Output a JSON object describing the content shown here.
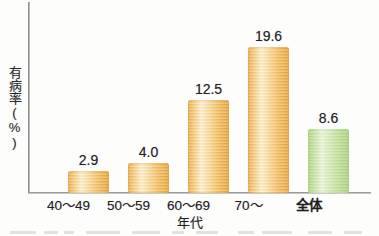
{
  "chart_data": {
    "type": "bar",
    "title": "",
    "xlabel": "年代",
    "ylabel": "有病率(%)",
    "categories": [
      "40～49",
      "50～59",
      "60～69",
      "70～",
      "全体"
    ],
    "values": [
      2.9,
      4.0,
      12.5,
      19.6,
      8.6
    ],
    "value_labels": [
      "2.9",
      "4.0",
      "12.5",
      "19.6",
      "8.6"
    ],
    "series": [
      {
        "name": "有病率",
        "values": [
          2.9,
          4.0,
          12.5,
          19.6,
          8.6
        ]
      }
    ],
    "bar_colors": [
      "#f0b44a",
      "#f0b44a",
      "#f0b44a",
      "#f0b44a",
      "#b5d98c"
    ],
    "highlight_category": "全体",
    "highlight_color": "#b5d98c",
    "primary_color": "#f0b44a",
    "ylim": [
      0,
      25.7
    ],
    "grid": false,
    "legend": "none",
    "axis_color": "#9a9a9a",
    "tick_labels_y": []
  },
  "axis": {
    "y_title": "有病率(%)",
    "x_title": "年代"
  }
}
